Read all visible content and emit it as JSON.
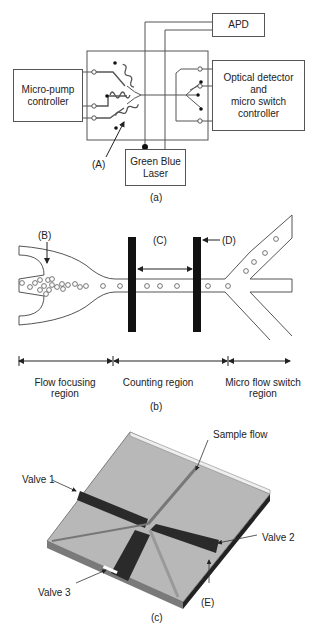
{
  "figure": {
    "panel_a": {
      "caption": "(a)",
      "boxes": {
        "apd": "APD",
        "micro_pump": [
          "Micro-pump",
          "controller"
        ],
        "optical": [
          "Optical detector",
          "and",
          "micro switch",
          "controller"
        ],
        "laser": [
          "Green Blue",
          "Laser"
        ]
      },
      "callout_a": "(A)"
    },
    "panel_b": {
      "caption": "(b)",
      "callouts": {
        "b": "(B)",
        "c": "(C)",
        "d": "(D)"
      },
      "regions": [
        {
          "label": [
            "Flow focusing",
            "region"
          ]
        },
        {
          "label": [
            "Counting region"
          ]
        },
        {
          "label": [
            "Micro flow switch",
            "region"
          ]
        }
      ]
    },
    "panel_c": {
      "caption": "(c)",
      "labels": {
        "sample_flow": "Sample flow",
        "valve1": "Valve 1",
        "valve2": "Valve 2",
        "valve3": "Valve 3",
        "e": "(E)"
      }
    },
    "colors": {
      "line": "#555555",
      "chip_gray": "#b5b5b5",
      "dark_channel": "#2a2a2a"
    }
  }
}
